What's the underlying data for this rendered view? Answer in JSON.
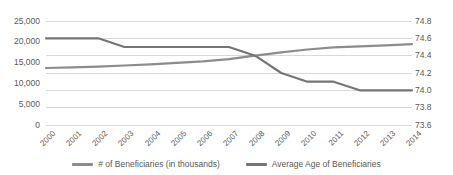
{
  "chart_data": {
    "type": "line",
    "title": "",
    "x_labels": [
      "2000",
      "2001",
      "2002",
      "2003",
      "2004",
      "2005",
      "2006",
      "2007",
      "2008",
      "2009",
      "2010",
      "2011",
      "2012",
      "2013",
      "2014"
    ],
    "series": [
      {
        "name": "# of Beneficiaries (in thousands)",
        "axis": "left",
        "color": "#8c8c8c",
        "values": [
          13700,
          13850,
          14050,
          14300,
          14600,
          14950,
          15300,
          15850,
          16650,
          17450,
          18150,
          18650,
          18900,
          19150,
          19450
        ]
      },
      {
        "name": "Average Age of Beneficiaries",
        "axis": "right",
        "color": "#757575",
        "values": [
          74.6,
          74.6,
          74.6,
          74.5,
          74.5,
          74.5,
          74.5,
          74.5,
          74.4,
          74.2,
          74.1,
          74.1,
          74.0,
          74.0,
          74.0
        ]
      }
    ],
    "left_axis": {
      "min": 0,
      "max": 25000,
      "tick_labels": [
        "25,000",
        "20,000",
        "15,000",
        "10,000",
        "5,000",
        "0"
      ]
    },
    "right_axis": {
      "min": 73.6,
      "max": 74.8,
      "tick_labels": [
        "74.8",
        "74.6",
        "74.4",
        "74.2",
        "74.0",
        "73.8",
        "73.6"
      ]
    },
    "grid": "horizontal gridlines at right-axis ticks",
    "legend_position": "bottom-center",
    "colors": {
      "gridline": "#d9d9d9",
      "axis_text": "#595959",
      "background": "#ffffff"
    }
  }
}
